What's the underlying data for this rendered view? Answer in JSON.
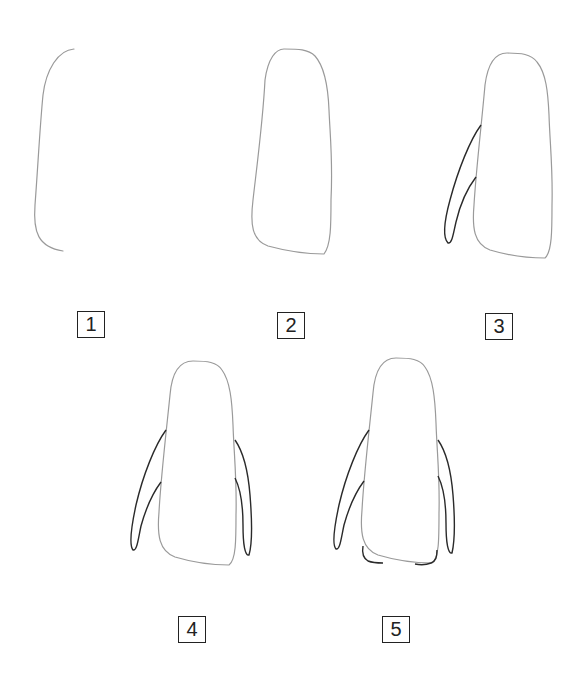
{
  "colors": {
    "outline_light": "#9a9a9a",
    "outline_dark": "#2a2a2a",
    "label_border": "#222222",
    "background": "#ffffff"
  },
  "steps": [
    {
      "number": "1",
      "description": "Left curved line of the body",
      "label_pos": [
        77,
        311
      ]
    },
    {
      "number": "2",
      "description": "Closed body outline",
      "label_pos": [
        277,
        312
      ]
    },
    {
      "number": "3",
      "description": "Body with left flipper",
      "label_pos": [
        485,
        313
      ]
    },
    {
      "number": "4",
      "description": "Body with both flippers",
      "label_pos": [
        178,
        616
      ]
    },
    {
      "number": "5",
      "description": "Body with flippers and feet",
      "label_pos": [
        382,
        616
      ]
    }
  ]
}
